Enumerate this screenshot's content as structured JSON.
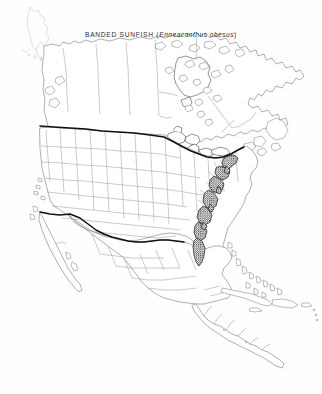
{
  "figure": {
    "kind": "species-distribution-map",
    "title_common_name": "BANDED SUNFISH",
    "title_scientific_name": "Enneacanthus obesus",
    "title_open_paren": "(",
    "title_close_paren": ")",
    "full_title": "BANDED SUNFISH (Enneacanthus obesus)",
    "background_color": "#ffffff",
    "width": 322,
    "height": 394
  },
  "map": {
    "region": "North America",
    "projection_style": "conic",
    "coastline_color": "#6d6d6d",
    "subdivision_color": "#8a8a8a",
    "international_border_color": "#111111",
    "range_fill_color": "#2a2a2a",
    "features": {
      "great_lakes": "outlined",
      "hudson_bay": "outlined",
      "caribbean_islands": "outlined",
      "baja_peninsula": "outlined",
      "florida_peninsula": "outlined"
    },
    "legend_items": [
      {
        "label": "distribution range",
        "swatch": "#2a2a2a"
      }
    ],
    "distribution_summary": "Atlantic coastal plain from southern New England south to Florida"
  }
}
